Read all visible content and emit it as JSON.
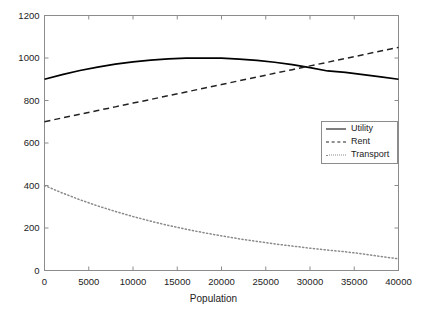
{
  "chart_data": {
    "type": "line",
    "title": "",
    "subtitle": "",
    "xlabel": "Population",
    "ylabel": "",
    "xlim": [
      0,
      40000
    ],
    "ylim": [
      0,
      1200
    ],
    "xticks": [
      0,
      5000,
      10000,
      15000,
      20000,
      25000,
      30000,
      35000,
      40000
    ],
    "xtick_labels": [
      "0",
      "5000",
      "10000",
      "15000",
      "20000",
      "25000",
      "30000",
      "35000",
      "40000"
    ],
    "yticks": [
      0,
      200,
      400,
      600,
      800,
      1000,
      1200
    ],
    "ytick_labels": [
      "0",
      "200",
      "400",
      "600",
      "800",
      "1000",
      "1200"
    ],
    "grid": false,
    "legend_position": "center-right",
    "x": [
      0,
      2000,
      4000,
      6000,
      8000,
      10000,
      12000,
      14000,
      16000,
      18000,
      20000,
      22000,
      24000,
      26000,
      28000,
      30000,
      32000,
      34000,
      36000,
      38000,
      40000
    ],
    "series": [
      {
        "name": "Utility",
        "style": "solid",
        "color": "#000000",
        "values": [
          900,
          922,
          941,
          957,
          971,
          982,
          990,
          996,
          999,
          1000,
          999,
          995,
          989,
          980,
          969,
          955,
          939,
          932,
          922,
          911,
          900
        ]
      },
      {
        "name": "Rent",
        "style": "dashed",
        "color": "#222222",
        "values": [
          700,
          718,
          735,
          753,
          770,
          788,
          805,
          823,
          840,
          858,
          875,
          893,
          910,
          928,
          945,
          963,
          980,
          998,
          1015,
          1033,
          1050
        ]
      },
      {
        "name": "Transport",
        "style": "dotted",
        "color": "#8a8a8a",
        "values": [
          400,
          365,
          333,
          304,
          278,
          254,
          232,
          212,
          194,
          178,
          163,
          149,
          137,
          125,
          115,
          105,
          96,
          88,
          78,
          66,
          55
        ]
      }
    ],
    "annotations": []
  },
  "legend": {
    "items": [
      {
        "label": "Utility"
      },
      {
        "label": "Rent"
      },
      {
        "label": "Transport"
      }
    ]
  },
  "axes": {
    "x_title": "Population"
  },
  "colors": {
    "background": "#ffffff",
    "axis": "#8c8c8c",
    "text": "#222222",
    "utility": "#000000",
    "rent": "#222222",
    "transport": "#8a8a8a"
  }
}
